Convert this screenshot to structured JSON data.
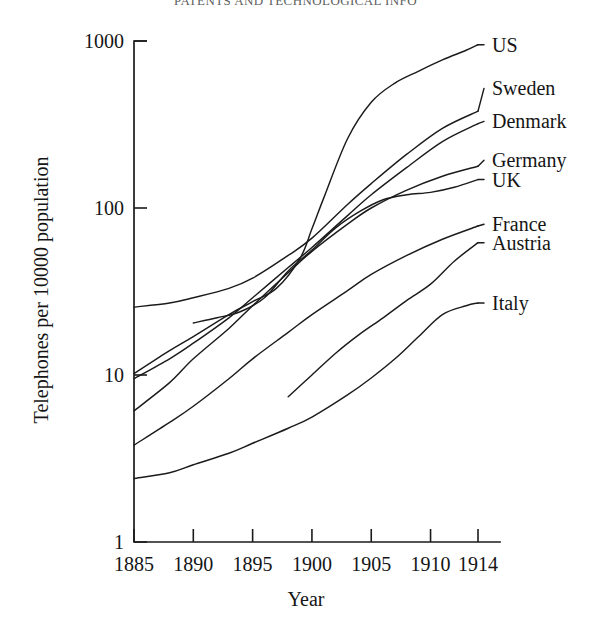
{
  "page": {
    "running_head": "PATENTS AND TECHNOLOGICAL INFO"
  },
  "chart_data": {
    "type": "line",
    "title": "",
    "xlabel": "Year",
    "ylabel": "Telephones per 10000 population",
    "yscale": "log",
    "xlim": [
      1885,
      1914
    ],
    "ylim": [
      1,
      1000
    ],
    "grid": false,
    "legend_position": "right-inline-labels",
    "xticks": [
      1885,
      1890,
      1895,
      1900,
      1905,
      1910,
      1914
    ],
    "xtick_labels": [
      "1885",
      "1890",
      "1895",
      "1900",
      "1905",
      "1910",
      "1914"
    ],
    "yticks": [
      1,
      10,
      100,
      1000
    ],
    "ytick_labels": [
      "1",
      "10",
      "100",
      "1000"
    ],
    "series": [
      {
        "name": "US",
        "label": "US",
        "x": [
          1885,
          1888,
          1890,
          1893,
          1895,
          1897,
          1899,
          1900,
          1901,
          1903,
          1905,
          1907,
          1909,
          1911,
          1913,
          1914
        ],
        "values": [
          10.2,
          14.0,
          17.0,
          23.0,
          27.5,
          33.0,
          50.0,
          75.0,
          115.0,
          260.0,
          430.0,
          560.0,
          660.0,
          770.0,
          880.0,
          950.0
        ]
      },
      {
        "name": "Sweden",
        "label": "Sweden",
        "x": [
          1885,
          1888,
          1890,
          1893,
          1895,
          1898,
          1900,
          1903,
          1905,
          1908,
          1911,
          1914
        ],
        "values": [
          25.5,
          27.0,
          29.0,
          33.0,
          38.0,
          52.0,
          66.0,
          105.0,
          140.0,
          210.0,
          300.0,
          380.0
        ]
      },
      {
        "name": "Denmark",
        "label": "Denmark",
        "x": [
          1885,
          1888,
          1890,
          1893,
          1895,
          1898,
          1900,
          1903,
          1905,
          1908,
          1911,
          1914
        ],
        "values": [
          9.5,
          12.5,
          15.5,
          22.0,
          29.0,
          44.0,
          58.0,
          90.0,
          120.0,
          175.0,
          250.0,
          320.0
        ]
      },
      {
        "name": "Germany",
        "label": "Germany",
        "x": [
          1885,
          1888,
          1890,
          1893,
          1895,
          1898,
          1900,
          1903,
          1905,
          1908,
          1911,
          1914
        ],
        "values": [
          6.1,
          9.0,
          12.5,
          19.0,
          26.0,
          41.0,
          55.0,
          80.0,
          100.0,
          128.0,
          155.0,
          178.0
        ]
      },
      {
        "name": "UK",
        "label": "UK",
        "x": [
          1890,
          1892,
          1894,
          1896,
          1898,
          1900,
          1902,
          1904,
          1906,
          1908,
          1910,
          1912,
          1914
        ],
        "values": [
          20.5,
          22.0,
          24.0,
          29.0,
          42.0,
          56.0,
          76.0,
          95.0,
          112.0,
          120.0,
          124.0,
          133.0,
          148.0
        ]
      },
      {
        "name": "France",
        "label": "France",
        "x": [
          1885,
          1888,
          1890,
          1893,
          1895,
          1898,
          1900,
          1903,
          1905,
          1908,
          1911,
          1914
        ],
        "values": [
          3.8,
          5.2,
          6.5,
          9.5,
          12.5,
          18.0,
          23.0,
          32.0,
          40.0,
          52.0,
          65.0,
          78.0
        ]
      },
      {
        "name": "Austria",
        "label": "Austria",
        "x": [
          1898,
          1900,
          1902,
          1904,
          1906,
          1908,
          1910,
          1912,
          1914
        ],
        "values": [
          7.4,
          10.0,
          13.5,
          17.5,
          22.0,
          28.0,
          35.0,
          48.0,
          62.0
        ]
      },
      {
        "name": "Italy",
        "label": "Italy",
        "x": [
          1885,
          1888,
          1890,
          1893,
          1895,
          1898,
          1900,
          1903,
          1905,
          1907,
          1909,
          1911,
          1913,
          1914
        ],
        "values": [
          2.4,
          2.6,
          2.9,
          3.4,
          3.9,
          4.8,
          5.6,
          7.6,
          9.6,
          12.5,
          17.0,
          23.0,
          26.0,
          27.0
        ]
      }
    ],
    "label_anchors": [
      {
        "name": "US",
        "x": 1914,
        "y": 950.0
      },
      {
        "name": "Sweden",
        "x": 1914,
        "y": 520.0
      },
      {
        "name": "Denmark",
        "x": 1914,
        "y": 330.0
      },
      {
        "name": "Germany",
        "x": 1914,
        "y": 193.0
      },
      {
        "name": "UK",
        "x": 1914,
        "y": 148.0
      },
      {
        "name": "France",
        "x": 1914,
        "y": 80.0
      },
      {
        "name": "Austria",
        "x": 1914,
        "y": 62.0
      },
      {
        "name": "Italy",
        "x": 1914,
        "y": 27.0
      }
    ]
  }
}
